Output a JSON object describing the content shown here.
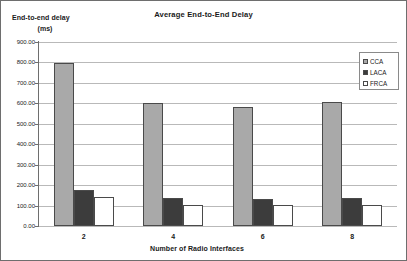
{
  "chart_data": {
    "type": "bar",
    "title": "Average End-to-End Delay",
    "xlabel": "Number of Radio Interfaces",
    "ylabel_line1": "End-to-end delay",
    "ylabel_line2": "(ms)",
    "categories": [
      "2",
      "4",
      "6",
      "8"
    ],
    "series": [
      {
        "name": "CCA",
        "color": "#a9a9a9",
        "values": [
          795,
          600,
          580,
          608
        ]
      },
      {
        "name": "LACA",
        "color": "#3c3c3c",
        "values": [
          178,
          135,
          133,
          137
        ]
      },
      {
        "name": "FRCA",
        "color": "#ffffff",
        "values": [
          140,
          103,
          102,
          104
        ]
      }
    ],
    "ylim": [
      0,
      900
    ],
    "ytick_step": 100,
    "ytick_labels": [
      "0.00",
      "100.00",
      "200.00",
      "300.00",
      "400.00",
      "500.00",
      "600.00",
      "700.00",
      "800.00",
      "900.00"
    ],
    "grid": true,
    "grid_color": "#b9b9b9",
    "legend_position": "top-right",
    "axis_color": "#6e6e6e",
    "bar_border_color": "#4a4a4a",
    "plot_background": "#ffffff"
  }
}
